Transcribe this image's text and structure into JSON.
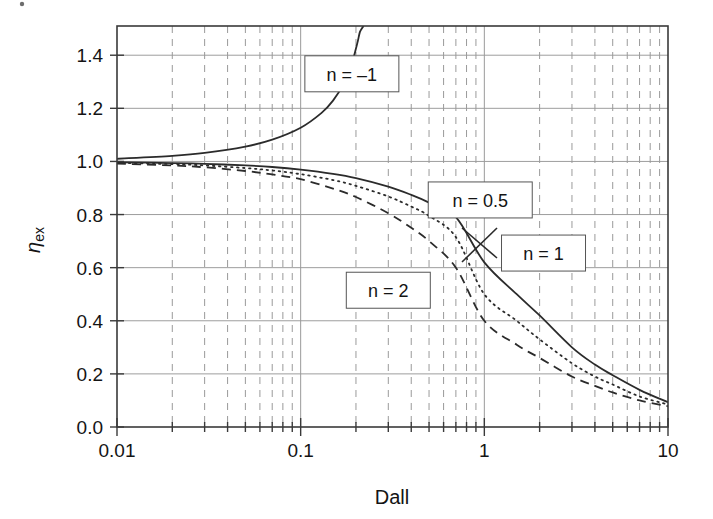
{
  "figure": {
    "background_color": "#ffffff",
    "line_color": "#2b2b2b",
    "grid_color": "#9a9a9a"
  },
  "chart_data": {
    "type": "line",
    "title": "",
    "xlabel": "Dall",
    "ylabel": "ηex",
    "ylabel_base": "η",
    "ylabel_sub": "ex",
    "xscale": "log",
    "yscale": "linear",
    "xlim": [
      0.01,
      10
    ],
    "ylim": [
      0.0,
      1.51
    ],
    "grid": true,
    "grid_minor": true,
    "legend_position": "inline-annotations",
    "xticks": [
      0.01,
      0.1,
      1,
      10
    ],
    "xtick_labels": [
      "0.01",
      "0.1",
      "1",
      "10"
    ],
    "yticks": [
      0.0,
      0.2,
      0.4,
      0.6,
      0.8,
      1.0,
      1.2,
      1.4
    ],
    "ytick_labels": [
      "0.0",
      "0.2",
      "0.4",
      "0.6",
      "0.8",
      "1.0",
      "1.2",
      "1.4"
    ],
    "annotations": [
      {
        "label": "n = –1",
        "n": -1,
        "x_box": 0.19,
        "y_box": 1.33
      },
      {
        "label": "n = 0.5",
        "n": 0.5,
        "x_box": 0.95,
        "y_box": 0.855
      },
      {
        "label": "n = 1",
        "n": 1,
        "x_box": 2.1,
        "y_box": 0.655
      },
      {
        "label": "n = 2",
        "n": 2,
        "x_box": 0.3,
        "y_box": 0.515
      }
    ],
    "series": [
      {
        "name": "n = –1",
        "style": "solid",
        "x": [
          0.01,
          0.02,
          0.03,
          0.05,
          0.07,
          0.1,
          0.13,
          0.15,
          0.17,
          0.19,
          0.2,
          0.205,
          0.21,
          0.215,
          0.22
        ],
        "y": [
          1.01,
          1.021,
          1.032,
          1.056,
          1.082,
          1.127,
          1.183,
          1.229,
          1.288,
          1.37,
          1.425,
          1.455,
          1.487,
          1.5,
          1.51
        ]
      },
      {
        "name": "n = 0.5",
        "style": "solid",
        "x": [
          0.01,
          0.02,
          0.03,
          0.05,
          0.07,
          0.1,
          0.15,
          0.2,
          0.3,
          0.4,
          0.5,
          0.7,
          1.0,
          1.5,
          2.0,
          3.0,
          4.0,
          5.0,
          7.0,
          10.0
        ],
        "y": [
          0.997,
          0.994,
          0.991,
          0.985,
          0.979,
          0.969,
          0.953,
          0.937,
          0.905,
          0.874,
          0.845,
          0.79,
          0.62,
          0.5,
          0.42,
          0.3,
          0.235,
          0.195,
          0.14,
          0.093
        ]
      },
      {
        "name": "n = 1",
        "style": "dotted",
        "x": [
          0.01,
          0.02,
          0.03,
          0.05,
          0.07,
          0.1,
          0.15,
          0.2,
          0.3,
          0.4,
          0.5,
          0.7,
          1.0,
          1.5,
          2.0,
          3.0,
          4.0,
          5.0,
          7.0,
          10.0
        ],
        "y": [
          0.995,
          0.99,
          0.985,
          0.975,
          0.966,
          0.952,
          0.93,
          0.908,
          0.868,
          0.83,
          0.795,
          0.715,
          0.5,
          0.4,
          0.33,
          0.24,
          0.19,
          0.16,
          0.115,
          0.085
        ]
      },
      {
        "name": "n = 2",
        "style": "dashed",
        "x": [
          0.01,
          0.02,
          0.03,
          0.05,
          0.07,
          0.1,
          0.15,
          0.2,
          0.3,
          0.4,
          0.5,
          0.7,
          1.0,
          1.5,
          2.0,
          3.0,
          4.0,
          5.0,
          7.0,
          10.0
        ],
        "y": [
          0.992,
          0.985,
          0.978,
          0.964,
          0.951,
          0.933,
          0.898,
          0.866,
          0.805,
          0.75,
          0.7,
          0.6,
          0.4,
          0.31,
          0.26,
          0.19,
          0.155,
          0.13,
          0.1,
          0.078
        ]
      }
    ]
  }
}
